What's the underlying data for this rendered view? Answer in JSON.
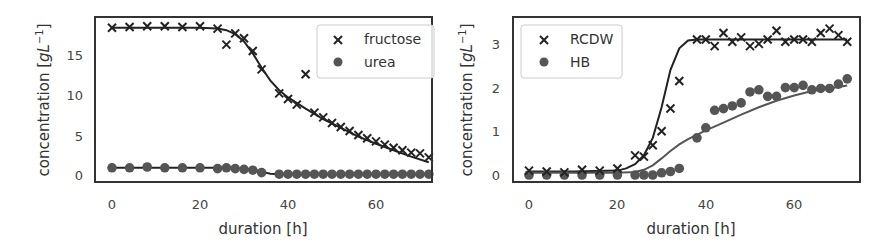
{
  "chart_data": [
    {
      "type": "scatter",
      "title": "",
      "xlabel": "duration [h]",
      "ylabel": "concentration [gL^-1]",
      "xlim": [
        -4,
        74
      ],
      "ylim": [
        -1,
        19
      ],
      "xticks": [
        0,
        20,
        40,
        60
      ],
      "yticks": [
        0,
        5,
        10,
        15
      ],
      "grid": false,
      "legend_position": "upper right",
      "series": [
        {
          "name": "fructose",
          "marker": "x",
          "x": [
            0,
            4,
            8,
            12,
            16,
            20,
            24,
            26,
            28,
            30,
            32,
            34,
            38,
            40,
            42,
            44,
            46,
            48,
            50,
            52,
            54,
            56,
            58,
            60,
            62,
            64,
            66,
            68,
            70,
            72
          ],
          "y": [
            18.4,
            18.5,
            18.6,
            18.6,
            18.5,
            18.6,
            18.3,
            16.3,
            17.7,
            17.1,
            15.5,
            13.2,
            10.2,
            9.5,
            8.8,
            12.6,
            7.8,
            7.2,
            6.5,
            6.0,
            5.5,
            5.0,
            4.6,
            4.2,
            3.8,
            3.4,
            3.1,
            2.8,
            2.7,
            2.2
          ]
        },
        {
          "name": "urea",
          "marker": "o",
          "x": [
            0,
            4,
            8,
            12,
            16,
            20,
            24,
            26,
            28,
            30,
            32,
            34,
            38,
            40,
            42,
            44,
            46,
            48,
            50,
            52,
            54,
            56,
            58,
            60,
            62,
            64,
            66,
            68,
            70,
            72
          ],
          "y": [
            0.9,
            0.9,
            1.0,
            0.9,
            0.9,
            0.9,
            0.8,
            0.9,
            0.8,
            0.7,
            0.6,
            0.3,
            0.1,
            0.1,
            0.1,
            0.1,
            0.1,
            0.1,
            0.1,
            0.1,
            0.1,
            0.1,
            0.1,
            0.1,
            0.1,
            0.1,
            0.1,
            0.1,
            0.1,
            0.1
          ]
        },
        {
          "name": "fructose fit",
          "type": "line",
          "x": [
            0,
            10,
            20,
            24,
            26,
            28,
            30,
            32,
            34,
            36,
            38,
            40,
            44,
            48,
            52,
            56,
            60,
            64,
            68,
            72
          ],
          "y": [
            18.4,
            18.4,
            18.4,
            18.3,
            18.1,
            17.6,
            16.7,
            15.2,
            13.4,
            11.8,
            10.6,
            9.7,
            8.3,
            7.0,
            5.9,
            4.8,
            3.9,
            3.1,
            2.3,
            1.6
          ]
        },
        {
          "name": "urea fit",
          "type": "line",
          "x": [
            0,
            10,
            20,
            24,
            28,
            32,
            34,
            36,
            38,
            72
          ],
          "y": [
            0.9,
            0.9,
            0.9,
            0.9,
            0.85,
            0.7,
            0.4,
            0.15,
            0.1,
            0.1
          ]
        }
      ]
    },
    {
      "type": "scatter",
      "title": "",
      "xlabel": "duration [h]",
      "ylabel": "concentration [gL^-1]",
      "xlim": [
        -4,
        74
      ],
      "ylim": [
        -0.15,
        3.6
      ],
      "xticks": [
        0,
        20,
        40,
        60
      ],
      "yticks": [
        0,
        1,
        2,
        3
      ],
      "grid": false,
      "legend_position": "upper left",
      "series": [
        {
          "name": "RCDW",
          "marker": "x",
          "x": [
            0,
            4,
            8,
            12,
            16,
            20,
            24,
            26,
            28,
            30,
            32,
            34,
            38,
            40,
            42,
            44,
            46,
            48,
            50,
            52,
            54,
            56,
            58,
            60,
            62,
            64,
            66,
            68,
            70,
            72
          ],
          "y": [
            0.1,
            0.08,
            0.06,
            0.12,
            0.1,
            0.15,
            0.45,
            0.42,
            0.68,
            1.0,
            1.52,
            2.15,
            3.1,
            3.1,
            2.95,
            3.25,
            3.05,
            3.15,
            2.95,
            3.0,
            3.1,
            3.3,
            3.05,
            3.1,
            3.1,
            3.05,
            3.25,
            3.35,
            3.2,
            3.05
          ]
        },
        {
          "name": "HB",
          "marker": "o",
          "x": [
            0,
            4,
            8,
            12,
            16,
            20,
            24,
            26,
            28,
            30,
            32,
            34,
            38,
            40,
            42,
            44,
            46,
            48,
            50,
            52,
            54,
            56,
            58,
            60,
            62,
            64,
            66,
            68,
            70,
            72
          ],
          "y": [
            0.0,
            0.0,
            0.0,
            0.0,
            0.0,
            0.0,
            0.0,
            0.0,
            0.0,
            0.05,
            0.08,
            0.15,
            0.85,
            1.08,
            1.48,
            1.52,
            1.58,
            1.65,
            1.9,
            1.95,
            1.8,
            1.8,
            2.0,
            2.0,
            2.05,
            1.95,
            1.98,
            1.98,
            2.08,
            2.2
          ]
        },
        {
          "name": "RCDW fit",
          "type": "line",
          "x": [
            0,
            10,
            20,
            22,
            24,
            26,
            28,
            30,
            32,
            34,
            36,
            38,
            72
          ],
          "y": [
            0.08,
            0.08,
            0.1,
            0.15,
            0.25,
            0.45,
            0.85,
            1.55,
            2.4,
            2.9,
            3.08,
            3.1,
            3.1
          ]
        },
        {
          "name": "HB fit",
          "type": "line",
          "x": [
            0,
            20,
            24,
            26,
            28,
            30,
            32,
            34,
            36,
            40,
            44,
            48,
            52,
            56,
            60,
            64,
            68,
            72
          ],
          "y": [
            0.05,
            0.05,
            0.07,
            0.12,
            0.22,
            0.38,
            0.55,
            0.7,
            0.82,
            1.02,
            1.2,
            1.38,
            1.55,
            1.7,
            1.82,
            1.92,
            1.98,
            2.05
          ]
        }
      ]
    }
  ],
  "plots": [
    {
      "ylabel_main": "concentration [",
      "ylabel_unit": "gL",
      "ylabel_exp": "−1",
      "ylabel_close": "]",
      "xlabel": "duration [h]",
      "xtick_labels": [
        "0",
        "20",
        "40",
        "60"
      ],
      "ytick_labels": [
        "0",
        "5",
        "10",
        "15"
      ],
      "legend": [
        "fructose",
        "urea"
      ]
    },
    {
      "ylabel_main": "concentration [",
      "ylabel_unit": "gL",
      "ylabel_exp": "−1",
      "ylabel_close": "]",
      "xlabel": "duration [h]",
      "xtick_labels": [
        "0",
        "20",
        "40",
        "60"
      ],
      "ytick_labels": [
        "0",
        "1",
        "2",
        "3"
      ],
      "legend": [
        "RCDW",
        "HB"
      ]
    }
  ],
  "colors": {
    "marker_x": "#222222",
    "marker_dot": "#555555",
    "fit_dark": "#222222",
    "fit_light": "#555555",
    "frame": "#333333"
  }
}
